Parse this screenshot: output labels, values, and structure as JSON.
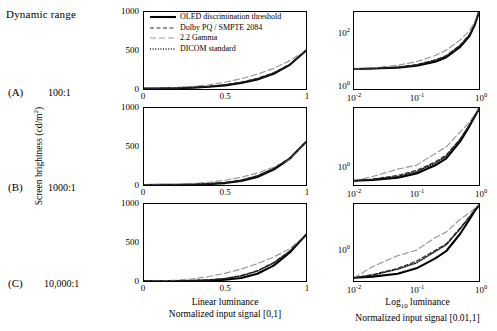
{
  "header": {
    "dynamic_range_title": "Dynamic range"
  },
  "rows": [
    {
      "letter": "(A)",
      "ratio": "100:1"
    },
    {
      "letter": "(B)",
      "ratio": "1000:1"
    },
    {
      "letter": "(C)",
      "ratio": "10,000:1"
    }
  ],
  "axes": {
    "y_caption": "Screen brightness (cd/m",
    "y_caption_sup": "2",
    "y_caption_tail": ")",
    "linear_yticks": [
      "1000",
      "500",
      "0"
    ],
    "linear_xticks": [
      "0",
      "0.5",
      "1"
    ],
    "log_xticks": [
      "-2",
      "-1",
      "0"
    ],
    "log_yticks_row_a": [
      "2",
      "0"
    ],
    "log_yticks_row_b": [
      "0"
    ],
    "log_yticks_row_c": [
      "0"
    ]
  },
  "columns": [
    {
      "line1": "Linear luminance",
      "line2": "Normalized input signal [0,1]"
    },
    {
      "line1": "Log",
      "sub": "10",
      "line1b": " luminance",
      "line2": "Normalized input signal [0.01,1]"
    }
  ],
  "legend": {
    "items": [
      {
        "label": "OLED discrimination threshold",
        "style": "solid",
        "color": "#000000",
        "width": 2.1
      },
      {
        "label": "Dolby PQ / SMPTE 2084",
        "style": "dashed",
        "color": "#333333",
        "width": 1.2
      },
      {
        "label": "2.2 Gamma",
        "style": "longdash",
        "color": "#9a9a9a",
        "width": 1.2
      },
      {
        "label": "DICOM standard",
        "style": "dotted",
        "color": "#1a1a1a",
        "width": 1.5
      }
    ]
  },
  "chart_data": {
    "type": "line",
    "xlabel_linear": "Normalized input signal [0,1]",
    "xlabel_log": "Normalized input signal [0.01,1]",
    "ylabel": "Screen brightness (cd/m^2)",
    "series_names": [
      "OLED discrimination threshold",
      "Dolby PQ / SMPTE 2084",
      "2.2 Gamma",
      "DICOM standard"
    ],
    "panels": [
      {
        "row": "(A)",
        "dynamic_range": "100:1",
        "column": "linear",
        "xlim": [
          0,
          1
        ],
        "ylim": [
          0,
          1000
        ],
        "xticks": [
          0,
          0.5,
          1
        ],
        "yticks": [
          0,
          500,
          1000
        ],
        "grid": false,
        "x": [
          0,
          0.1,
          0.2,
          0.3,
          0.4,
          0.5,
          0.6,
          0.7,
          0.8,
          0.9,
          1.0
        ],
        "series": [
          {
            "name": "OLED discrimination threshold",
            "values": [
              5,
              7,
              11,
              18,
              29,
              47,
              77,
              124,
              198,
              314,
              500
            ]
          },
          {
            "name": "Dolby PQ / SMPTE 2084",
            "values": [
              5,
              8,
              13,
              22,
              35,
              56,
              89,
              138,
              211,
              320,
              500
            ]
          },
          {
            "name": "2.2 Gamma",
            "values": [
              5,
              9,
              17,
              32,
              55,
              88,
              133,
              192,
              268,
              368,
              500
            ]
          },
          {
            "name": "DICOM standard",
            "values": [
              5,
              8,
              12,
              20,
              32,
              52,
              84,
              132,
              205,
              315,
              500
            ]
          }
        ]
      },
      {
        "row": "(A)",
        "dynamic_range": "100:1",
        "column": "log",
        "xlim": [
          0.01,
          1
        ],
        "ylim": [
          1,
          500
        ],
        "xticks": [
          0.01,
          0.1,
          1
        ],
        "yticks": [
          1,
          100
        ],
        "xscale": "log",
        "yscale": "log",
        "grid": false,
        "x": [
          0.01,
          0.02,
          0.05,
          0.1,
          0.2,
          0.3,
          0.5,
          0.7,
          0.85,
          1.0
        ],
        "series": [
          {
            "name": "OLED discrimination threshold",
            "values": [
              5,
              5.2,
              5.6,
              6.5,
              9,
              13,
              30,
              70,
              170,
              500
            ]
          },
          {
            "name": "Dolby PQ / SMPTE 2084",
            "values": [
              5,
              5.3,
              5.9,
              7.2,
              10.5,
              15,
              35,
              80,
              185,
              500
            ]
          },
          {
            "name": "2.2 Gamma",
            "values": [
              5,
              5.5,
              6.8,
              9,
              15,
              23,
              52,
              110,
              220,
              500
            ]
          },
          {
            "name": "DICOM standard",
            "values": [
              5,
              5.2,
              5.7,
              6.9,
              10,
              14,
              33,
              76,
              180,
              500
            ]
          }
        ]
      },
      {
        "row": "(B)",
        "dynamic_range": "1000:1",
        "column": "linear",
        "xlim": [
          0,
          1
        ],
        "ylim": [
          0,
          1000
        ],
        "xticks": [
          0,
          0.5,
          1
        ],
        "yticks": [
          0,
          500,
          1000
        ],
        "grid": false,
        "x": [
          0,
          0.1,
          0.2,
          0.3,
          0.4,
          0.5,
          0.6,
          0.7,
          0.8,
          0.9,
          1.0
        ],
        "series": [
          {
            "name": "OLED discrimination threshold",
            "values": [
              0.6,
              1.2,
              2.6,
              5.6,
              12,
              25,
              52,
              105,
              200,
              340,
              560
            ]
          },
          {
            "name": "Dolby PQ / SMPTE 2084",
            "values": [
              0.6,
              1.6,
              3.6,
              7.8,
              16,
              33,
              64,
              120,
              215,
              350,
              560
            ]
          },
          {
            "name": "2.2 Gamma",
            "values": [
              0.6,
              2.6,
              8,
              18,
              35,
              62,
              100,
              155,
              230,
              330,
              560
            ]
          },
          {
            "name": "DICOM standard",
            "values": [
              0.6,
              1.4,
              3.2,
              7,
              15,
              31,
              62,
              118,
              212,
              348,
              560
            ]
          }
        ]
      },
      {
        "row": "(B)",
        "dynamic_range": "1000:1",
        "column": "log",
        "xlim": [
          0.01,
          1
        ],
        "ylim": [
          0.4,
          600
        ],
        "xticks": [
          0.01,
          0.1,
          1
        ],
        "yticks": [
          1
        ],
        "xscale": "log",
        "yscale": "log",
        "grid": false,
        "x": [
          0.01,
          0.02,
          0.05,
          0.1,
          0.2,
          0.3,
          0.5,
          0.7,
          0.85,
          1.0
        ],
        "series": [
          {
            "name": "OLED discrimination threshold",
            "values": [
              0.6,
              0.65,
              0.8,
              1.2,
              2.6,
              5,
              25,
              105,
              260,
              560
            ]
          },
          {
            "name": "Dolby PQ / SMPTE 2084",
            "values": [
              0.6,
              0.7,
              1.0,
              1.6,
              3.6,
              7,
              32,
              120,
              280,
              560
            ]
          },
          {
            "name": "2.2 Gamma",
            "values": [
              0.6,
              0.9,
              1.8,
              2.6,
              8,
              15,
              62,
              155,
              320,
              560
            ]
          },
          {
            "name": "DICOM standard",
            "values": [
              0.6,
              0.68,
              0.9,
              1.4,
              3.2,
              6.2,
              30,
              118,
              275,
              560
            ]
          }
        ]
      },
      {
        "row": "(C)",
        "dynamic_range": "10,000:1",
        "column": "linear",
        "xlim": [
          0,
          1
        ],
        "ylim": [
          0,
          1000
        ],
        "xticks": [
          0,
          0.5,
          1
        ],
        "yticks": [
          0,
          500,
          1000
        ],
        "grid": false,
        "x": [
          0,
          0.1,
          0.2,
          0.3,
          0.4,
          0.5,
          0.6,
          0.7,
          0.8,
          0.9,
          1.0
        ],
        "series": [
          {
            "name": "OLED discrimination threshold",
            "values": [
              0.06,
              0.2,
              0.7,
              2.2,
              6,
              16,
              40,
              95,
              200,
              370,
              600
            ]
          },
          {
            "name": "Dolby PQ / SMPTE 2084",
            "values": [
              0.06,
              0.5,
              2,
              6,
              15,
              34,
              70,
              135,
              240,
              390,
              600
            ]
          },
          {
            "name": "2.2 Gamma",
            "values": [
              0.06,
              2,
              10,
              28,
              58,
              100,
              155,
              225,
              310,
              420,
              600
            ]
          },
          {
            "name": "DICOM standard",
            "values": [
              0.06,
              0.4,
              1.7,
              5.2,
              13,
              30,
              65,
              128,
              232,
              385,
              600
            ]
          }
        ]
      },
      {
        "row": "(C)",
        "dynamic_range": "10,000:1",
        "column": "log",
        "xlim": [
          0.01,
          1
        ],
        "ylim": [
          0.04,
          700
        ],
        "xticks": [
          0.01,
          0.1,
          1
        ],
        "yticks": [
          1
        ],
        "xscale": "log",
        "yscale": "log",
        "grid": false,
        "x": [
          0.01,
          0.02,
          0.05,
          0.1,
          0.2,
          0.3,
          0.5,
          0.7,
          0.85,
          1.0
        ],
        "series": [
          {
            "name": "OLED discrimination threshold",
            "values": [
              0.06,
              0.07,
              0.1,
              0.2,
              0.7,
              1.8,
              16,
              95,
              280,
              600
            ]
          },
          {
            "name": "Dolby PQ / SMPTE 2084",
            "values": [
              0.06,
              0.09,
              0.2,
              0.5,
              2,
              4.5,
              34,
              135,
              330,
              600
            ]
          },
          {
            "name": "2.2 Gamma",
            "values": [
              0.06,
              0.25,
              1,
              2,
              10,
              20,
              100,
              225,
              400,
              600
            ]
          },
          {
            "name": "DICOM standard",
            "values": [
              0.06,
              0.085,
              0.18,
              0.4,
              1.7,
              4,
              30,
              128,
              320,
              600
            ]
          }
        ]
      }
    ]
  }
}
